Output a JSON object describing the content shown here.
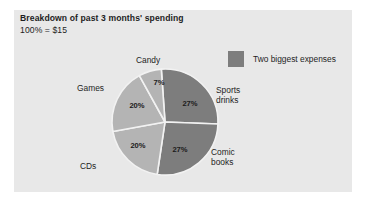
{
  "panel": {
    "background": "#e8e8e8"
  },
  "header": {
    "title": "Breakdown of past 3 months' spending",
    "subtitle": "100% = $15"
  },
  "legend": {
    "swatch_color": "#7d7d7d",
    "label": "Two biggest expenses",
    "position": "top-right"
  },
  "colors": {
    "dark_slice": "#7d7d7d",
    "light_slice": "#b4b4b4",
    "separator": "#f2f2f2",
    "text": "#1e1e1e",
    "page_background": "#ffffff"
  },
  "chart_data": {
    "type": "pie",
    "title": "Breakdown of past 3 months' spending",
    "subtitle": "100% = $15",
    "total_label": "100% = $15",
    "total_value": 15,
    "total_currency": "$",
    "categories": [
      "Sports drinks",
      "Comic books",
      "CDs",
      "Games",
      "Candy"
    ],
    "values": [
      27,
      27,
      20,
      20,
      7
    ],
    "value_labels": [
      "27%",
      "27%",
      "20%",
      "20%",
      "7%"
    ],
    "unit": "%",
    "slice_colors": [
      "#7d7d7d",
      "#7d7d7d",
      "#b4b4b4",
      "#b4b4b4",
      "#b4b4b4"
    ],
    "highlighted": [
      "Sports drinks",
      "Comic books"
    ],
    "legend": [
      "Two biggest expenses"
    ],
    "start_angle_deg": -4,
    "direction": "clockwise",
    "xlabel": "",
    "ylabel": "",
    "grid": false,
    "slices": [
      {
        "name": "Sports drinks",
        "pct": "27%",
        "value": 27,
        "color": "#7d7d7d",
        "pct_x": 190,
        "pct_y": 104,
        "label_x": 216,
        "label_y": 93,
        "label_lines": [
          "Sports",
          "drinks"
        ]
      },
      {
        "name": "Comic books",
        "pct": "27%",
        "value": 27,
        "color": "#7d7d7d",
        "pct_x": 180,
        "pct_y": 150,
        "label_x": 211,
        "label_y": 155,
        "label_lines": [
          "Comic",
          "books"
        ]
      },
      {
        "name": "CDs",
        "pct": "20%",
        "value": 20,
        "color": "#b4b4b4",
        "pct_x": 138,
        "pct_y": 146,
        "label_x": 80,
        "label_y": 169,
        "label_lines": [
          "CDs"
        ]
      },
      {
        "name": "Games",
        "pct": "20%",
        "value": 20,
        "color": "#b4b4b4",
        "pct_x": 137,
        "pct_y": 106,
        "label_x": 77,
        "label_y": 91,
        "label_lines": [
          "Games"
        ]
      },
      {
        "name": "Candy",
        "pct": "7%",
        "value": 7,
        "color": "#b4b4b4",
        "pct_x": 159,
        "pct_y": 83,
        "label_x": 136,
        "label_y": 63,
        "label_lines": [
          "Candy"
        ]
      }
    ],
    "geometry": {
      "cx": 165,
      "cy": 122,
      "r": 53
    }
  }
}
